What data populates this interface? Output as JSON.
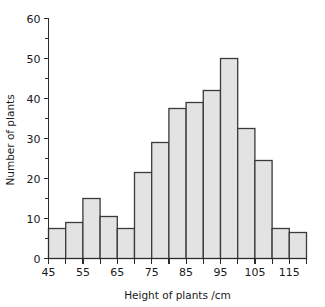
{
  "chart_data": {
    "type": "bar",
    "title": "",
    "subtitle": "",
    "xlabel": "Height of plants /cm",
    "ylabel": "Number of plants",
    "grid": false,
    "legend": "none",
    "bin_width": 5,
    "xlim": [
      45,
      120
    ],
    "ylim": [
      0,
      60
    ],
    "x_tick_step": 5,
    "x_labeled_ticks": [
      45,
      55,
      65,
      75,
      85,
      95,
      105,
      115
    ],
    "x_tick_labels": [
      "45",
      "55",
      "65",
      "75",
      "85",
      "95",
      "105",
      "115"
    ],
    "y_ticks": [
      0,
      10,
      20,
      30,
      40,
      50,
      60
    ],
    "y_tick_labels": [
      "0",
      "10",
      "20",
      "30",
      "40",
      "50",
      "60"
    ],
    "y_minor_step": 5,
    "bins": [
      {
        "start": 45,
        "end": 50,
        "label": "45-50",
        "value": 7.5
      },
      {
        "start": 50,
        "end": 55,
        "label": "50-55",
        "value": 9
      },
      {
        "start": 55,
        "end": 60,
        "label": "55-60",
        "value": 15
      },
      {
        "start": 60,
        "end": 65,
        "label": "60-65",
        "value": 10.5
      },
      {
        "start": 65,
        "end": 70,
        "label": "65-70",
        "value": 7.5
      },
      {
        "start": 70,
        "end": 75,
        "label": "70-75",
        "value": 21.5
      },
      {
        "start": 75,
        "end": 80,
        "label": "75-80",
        "value": 29
      },
      {
        "start": 80,
        "end": 85,
        "label": "80-85",
        "value": 37.5
      },
      {
        "start": 85,
        "end": 90,
        "label": "85-90",
        "value": 39
      },
      {
        "start": 90,
        "end": 95,
        "label": "90-95",
        "value": 42
      },
      {
        "start": 95,
        "end": 100,
        "label": "95-100",
        "value": 50
      },
      {
        "start": 100,
        "end": 105,
        "label": "100-105",
        "value": 32.5
      },
      {
        "start": 105,
        "end": 110,
        "label": "105-110",
        "value": 24.5
      },
      {
        "start": 110,
        "end": 115,
        "label": "110-115",
        "value": 7.5
      },
      {
        "start": 115,
        "end": 120,
        "label": "115-120",
        "value": 6.5
      }
    ],
    "categories": [
      "45-50",
      "50-55",
      "55-60",
      "60-65",
      "65-70",
      "70-75",
      "75-80",
      "80-85",
      "85-90",
      "90-95",
      "95-100",
      "100-105",
      "105-110",
      "110-115",
      "115-120"
    ],
    "values": [
      7.5,
      9,
      15,
      10.5,
      7.5,
      21.5,
      29,
      37.5,
      39,
      42,
      50,
      32.5,
      24.5,
      7.5,
      6.5
    ],
    "colors": {
      "bar_fill": "#e3e3e3",
      "bar_stroke": "#3a3a3a",
      "axis": "#2b2b2b",
      "text": "#1a1a1a",
      "background": "#ffffff"
    }
  }
}
